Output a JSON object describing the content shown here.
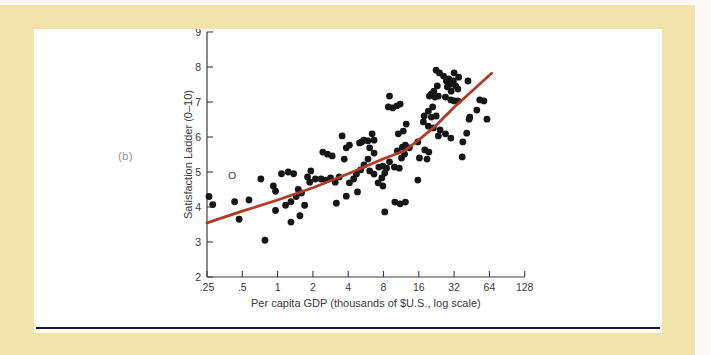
{
  "page": {
    "background_color": "#f1e3ab",
    "panel_background": "#ffffff",
    "panel_label": "(b)"
  },
  "chart_data": {
    "type": "scatter",
    "title": "",
    "xlabel": "Per capita GDP (thousands of $U.S., log scale)",
    "ylabel": "Satisfaction Ladder (0–10)",
    "x_scale": "log2",
    "x_ticks": [
      ".25",
      ".5",
      "1",
      "2",
      "4",
      "8",
      "16",
      "32",
      "64",
      "128"
    ],
    "x_tick_values": [
      0.25,
      0.5,
      1,
      2,
      4,
      8,
      16,
      32,
      64,
      128
    ],
    "y_ticks": [
      "2",
      "3",
      "4",
      "5",
      "6",
      "7",
      "8",
      "9"
    ],
    "y_tick_values": [
      2,
      3,
      4,
      5,
      6,
      7,
      8,
      9
    ],
    "xlim": [
      0.25,
      128
    ],
    "ylim": [
      2,
      9
    ],
    "grid": false,
    "legend": false,
    "point_color": "#161616",
    "axis_color": "#3c3c3c",
    "trend_color": "#b23b27",
    "points": [
      [
        0.26,
        4.3
      ],
      [
        0.28,
        4.07
      ],
      [
        0.43,
        4.15
      ],
      [
        0.57,
        4.2
      ],
      [
        0.47,
        3.65
      ],
      [
        0.72,
        4.8
      ],
      [
        0.92,
        4.6
      ],
      [
        0.96,
        4.45
      ],
      [
        1.08,
        4.95
      ],
      [
        1.23,
        5.0
      ],
      [
        1.37,
        4.95
      ],
      [
        1.5,
        4.5
      ],
      [
        1.6,
        4.4
      ],
      [
        1.44,
        4.3
      ],
      [
        1.3,
        4.15
      ],
      [
        1.17,
        4.05
      ],
      [
        0.96,
        3.9
      ],
      [
        1.3,
        3.57
      ],
      [
        1.55,
        3.75
      ],
      [
        1.7,
        4.05
      ],
      [
        0.78,
        3.05
      ],
      [
        1.92,
        5.03
      ],
      [
        1.8,
        4.86
      ],
      [
        1.88,
        4.71
      ],
      [
        2.1,
        4.8
      ],
      [
        2.43,
        5.57
      ],
      [
        2.66,
        5.51
      ],
      [
        2.92,
        5.46
      ],
      [
        2.35,
        4.8
      ],
      [
        2.57,
        4.77
      ],
      [
        2.83,
        4.83
      ],
      [
        3.1,
        4.71
      ],
      [
        3.35,
        4.86
      ],
      [
        3.7,
        5.37
      ],
      [
        3.85,
        5.69
      ],
      [
        4.1,
        5.77
      ],
      [
        5.0,
        5.83
      ],
      [
        5.45,
        5.91
      ],
      [
        6.1,
        5.69
      ],
      [
        6.65,
        5.54
      ],
      [
        5.9,
        5.37
      ],
      [
        5.45,
        5.2
      ],
      [
        5.1,
        5.06
      ],
      [
        4.7,
        4.94
      ],
      [
        4.45,
        4.8
      ],
      [
        4.1,
        4.69
      ],
      [
        4.8,
        4.43
      ],
      [
        3.85,
        4.31
      ],
      [
        3.17,
        4.11
      ],
      [
        6.1,
        5.03
      ],
      [
        6.65,
        4.94
      ],
      [
        7.3,
        5.14
      ],
      [
        7.9,
        5.17
      ],
      [
        8.5,
        5.11
      ],
      [
        8.2,
        4.97
      ],
      [
        7.75,
        4.83
      ],
      [
        7.2,
        4.69
      ],
      [
        7.9,
        4.6
      ],
      [
        9.0,
        5.29
      ],
      [
        9.9,
        5.14
      ],
      [
        10.9,
        5.11
      ],
      [
        10.5,
        5.6
      ],
      [
        11.6,
        5.71
      ],
      [
        12.3,
        5.77
      ],
      [
        13.3,
        5.69
      ],
      [
        12.1,
        5.51
      ],
      [
        11.4,
        5.4
      ],
      [
        10.0,
        4.14
      ],
      [
        11.1,
        4.09
      ],
      [
        12.3,
        4.14
      ],
      [
        8.2,
        3.86
      ],
      [
        3.55,
        6.03
      ],
      [
        5.2,
        5.86
      ],
      [
        6.4,
        6.09
      ],
      [
        6.65,
        5.91
      ],
      [
        5.9,
        5.89
      ],
      [
        8.8,
        6.86
      ],
      [
        9.0,
        7.17
      ],
      [
        9.6,
        6.83
      ],
      [
        10.4,
        6.89
      ],
      [
        11.1,
        6.94
      ],
      [
        12.5,
        6.37
      ],
      [
        10.7,
        6.09
      ],
      [
        11.8,
        6.17
      ],
      [
        15.7,
        5.86
      ],
      [
        18.0,
        5.63
      ],
      [
        19.5,
        5.57
      ],
      [
        16.2,
        5.4
      ],
      [
        18.8,
        5.37
      ],
      [
        37.5,
        5.43
      ],
      [
        15.7,
        4.77
      ],
      [
        38.0,
        5.86
      ],
      [
        22.5,
        7.91
      ],
      [
        24.0,
        7.83
      ],
      [
        26.0,
        7.74
      ],
      [
        32.0,
        7.83
      ],
      [
        35.0,
        7.71
      ],
      [
        27.5,
        7.6
      ],
      [
        29.5,
        7.51
      ],
      [
        23.0,
        7.46
      ],
      [
        21.5,
        7.31
      ],
      [
        19.7,
        7.17
      ],
      [
        28.8,
        7.66
      ],
      [
        31.5,
        7.6
      ],
      [
        33.0,
        7.46
      ],
      [
        28.0,
        7.43
      ],
      [
        30.2,
        7.31
      ],
      [
        34.5,
        7.37
      ],
      [
        42.0,
        7.6
      ],
      [
        30.0,
        7.06
      ],
      [
        32.0,
        7.03
      ],
      [
        34.5,
        7.03
      ],
      [
        21.0,
        6.86
      ],
      [
        19.3,
        6.74
      ],
      [
        17.8,
        6.6
      ],
      [
        20.5,
        6.57
      ],
      [
        22.5,
        6.6
      ],
      [
        17.5,
        6.43
      ],
      [
        19.3,
        6.31
      ],
      [
        21.3,
        6.26
      ],
      [
        24.3,
        6.2
      ],
      [
        27.0,
        6.09
      ],
      [
        23.5,
        6.03
      ],
      [
        30.0,
        5.97
      ],
      [
        41.0,
        6.11
      ],
      [
        43.5,
        6.57
      ],
      [
        53.0,
        7.06
      ],
      [
        57.5,
        7.03
      ],
      [
        61.0,
        6.51
      ],
      [
        43.0,
        6.51
      ],
      [
        50.0,
        6.77
      ],
      [
        27.0,
        7.14
      ],
      [
        23.5,
        7.17
      ],
      [
        22.0,
        7.14
      ],
      [
        20.5,
        7.23
      ]
    ],
    "open_points": [
      [
        0.41,
        4.9
      ]
    ],
    "trend_line": [
      [
        0.25,
        3.55
      ],
      [
        0.5,
        3.88
      ],
      [
        1,
        4.2
      ],
      [
        2,
        4.55
      ],
      [
        4,
        4.95
      ],
      [
        8,
        5.38
      ],
      [
        12,
        5.6
      ],
      [
        16,
        5.92
      ],
      [
        22,
        6.3
      ],
      [
        32,
        6.85
      ],
      [
        45,
        7.3
      ],
      [
        67,
        7.82
      ]
    ]
  }
}
